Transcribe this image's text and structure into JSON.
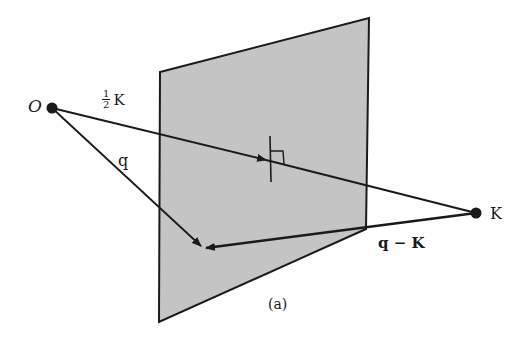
{
  "figure": {
    "caption": "(a)",
    "colors": {
      "plane_fill": "#c4c4c4",
      "line": "#1a1a1a",
      "background": "#ffffff"
    },
    "plane": {
      "corners": [
        [
          160,
          72
        ],
        [
          369,
          18
        ],
        [
          366,
          229
        ],
        [
          159,
          322
        ]
      ]
    },
    "points": {
      "origin": {
        "label": "O",
        "x": 52,
        "y": 108
      },
      "k": {
        "label": "K",
        "x": 476,
        "y": 213
      },
      "target": {
        "x": 203,
        "y": 248
      }
    },
    "labels": {
      "half_k_numerator": "1",
      "half_k_denominator": "2",
      "half_k_symbol": "K",
      "q": "q",
      "q_minus_k": "q − K",
      "k_point": "K",
      "origin": "O"
    }
  }
}
